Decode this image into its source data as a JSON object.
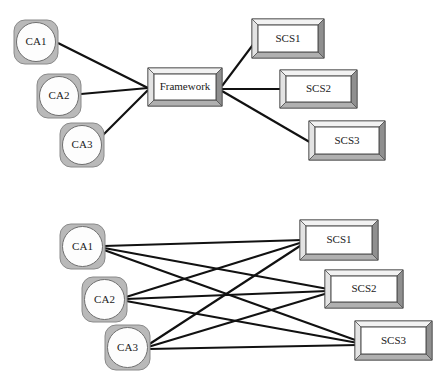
{
  "document": {
    "title": "Framework-mediated vs. point-to-point integration",
    "background_color": "#ffffff"
  },
  "style": {
    "node_outer_fill": "#b9b9b9",
    "node_outer_stroke": "#8a8a8a",
    "node_inner_fill": "#fdfdfd",
    "node_inner_stroke": "#6f6f6f",
    "box_face_fill": "#ffffff",
    "box_face_stroke": "#4a4a4a",
    "bevel_light": "#f2f2f2",
    "bevel_mid": "#c9c9c9",
    "bevel_dark": "#8f8f8f",
    "edge_color": "#111111",
    "edge_width": 2.1,
    "label_color": "#1a1a1a",
    "label_font_size": 11
  },
  "diagrams": [
    {
      "id": "framework-mediated",
      "name": "top-diagram",
      "description": "Three client applications connect through a central Framework to three supply chain systems",
      "hub": {
        "id": "framework",
        "label": "Framework",
        "shape": "beveled-box",
        "x": 148,
        "y": 68,
        "width": 74,
        "height": 38
      },
      "left_nodes": [
        {
          "id": "t-ca1",
          "label": "CA1",
          "shape": "rounded-square-circle",
          "x": 14,
          "y": 20,
          "size": 44
        },
        {
          "id": "t-ca2",
          "label": "CA2",
          "shape": "rounded-square-circle",
          "x": 37,
          "y": 74,
          "size": 44
        },
        {
          "id": "t-ca3",
          "label": "CA3",
          "shape": "rounded-square-circle",
          "x": 60,
          "y": 123,
          "size": 44
        }
      ],
      "right_nodes": [
        {
          "id": "t-scs1",
          "label": "SCS1",
          "shape": "beveled-box",
          "x": 252,
          "y": 19,
          "width": 72,
          "height": 39
        },
        {
          "id": "t-scs2",
          "label": "SCS2",
          "shape": "beveled-box",
          "x": 280,
          "y": 70,
          "width": 77,
          "height": 38
        },
        {
          "id": "t-scs3",
          "label": "SCS3",
          "shape": "beveled-box",
          "x": 309,
          "y": 121,
          "width": 76,
          "height": 39
        }
      ],
      "edges": [
        {
          "from": "t-ca1",
          "to": "framework",
          "x1": 58,
          "y1": 43,
          "x2": 148,
          "y2": 88
        },
        {
          "from": "t-ca2",
          "to": "framework",
          "x1": 81,
          "y1": 94,
          "x2": 148,
          "y2": 88
        },
        {
          "from": "t-ca3",
          "to": "framework",
          "x1": 100,
          "y1": 138,
          "x2": 148,
          "y2": 90
        },
        {
          "from": "framework",
          "to": "t-scs1",
          "x1": 222,
          "y1": 86,
          "x2": 255,
          "y2": 42
        },
        {
          "from": "framework",
          "to": "t-scs2",
          "x1": 222,
          "y1": 89,
          "x2": 282,
          "y2": 89
        },
        {
          "from": "framework",
          "to": "t-scs3",
          "x1": 222,
          "y1": 91,
          "x2": 313,
          "y2": 144
        }
      ],
      "edge_count": 6
    },
    {
      "id": "point-to-point",
      "name": "bottom-diagram",
      "description": "Three client applications each connect directly to all three supply chain systems",
      "left_nodes": [
        {
          "id": "b-ca1",
          "label": "CA1",
          "shape": "rounded-square-circle",
          "x": 60,
          "y": 224,
          "size": 45
        },
        {
          "id": "b-ca2",
          "label": "CA2",
          "shape": "rounded-square-circle",
          "x": 82,
          "y": 277,
          "size": 45
        },
        {
          "id": "b-ca3",
          "label": "CA3",
          "shape": "rounded-square-circle",
          "x": 105,
          "y": 325,
          "size": 45
        }
      ],
      "right_nodes": [
        {
          "id": "b-scs1",
          "label": "SCS1",
          "shape": "beveled-box",
          "x": 300,
          "y": 220,
          "width": 78,
          "height": 40
        },
        {
          "id": "b-scs2",
          "label": "SCS2",
          "shape": "beveled-box",
          "x": 325,
          "y": 270,
          "width": 78,
          "height": 38
        },
        {
          "id": "b-scs3",
          "label": "SCS3",
          "shape": "beveled-box",
          "x": 355,
          "y": 321,
          "width": 77,
          "height": 39
        }
      ],
      "edges": [
        {
          "from": "b-ca1",
          "to": "b-scs1",
          "x1": 104,
          "y1": 246,
          "x2": 303,
          "y2": 240
        },
        {
          "from": "b-ca1",
          "to": "b-scs2",
          "x1": 104,
          "y1": 248,
          "x2": 328,
          "y2": 289
        },
        {
          "from": "b-ca1",
          "to": "b-scs3",
          "x1": 104,
          "y1": 250,
          "x2": 358,
          "y2": 341
        },
        {
          "from": "b-ca2",
          "to": "b-scs1",
          "x1": 126,
          "y1": 297,
          "x2": 303,
          "y2": 242
        },
        {
          "from": "b-ca2",
          "to": "b-scs2",
          "x1": 126,
          "y1": 299,
          "x2": 328,
          "y2": 291
        },
        {
          "from": "b-ca2",
          "to": "b-scs3",
          "x1": 126,
          "y1": 301,
          "x2": 358,
          "y2": 343
        },
        {
          "from": "b-ca3",
          "to": "b-scs1",
          "x1": 148,
          "y1": 345,
          "x2": 303,
          "y2": 244
        },
        {
          "from": "b-ca3",
          "to": "b-scs2",
          "x1": 148,
          "y1": 347,
          "x2": 328,
          "y2": 293
        },
        {
          "from": "b-ca3",
          "to": "b-scs3",
          "x1": 148,
          "y1": 349,
          "x2": 358,
          "y2": 345
        }
      ],
      "edge_count": 9
    }
  ]
}
